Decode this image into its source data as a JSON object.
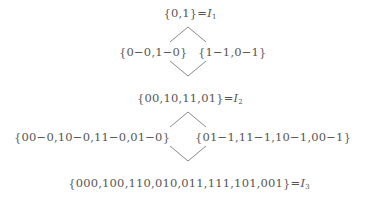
{
  "diagram": {
    "level1": {
      "set": "{0,1}",
      "eq": "=",
      "var": "I",
      "sub": "1"
    },
    "split1": {
      "left": "{0−0,1−0}",
      "right": "{1−1,0−1}"
    },
    "level2": {
      "set": "{00,10,11,01}",
      "eq": "=",
      "var": "I",
      "sub": "2"
    },
    "split2": {
      "left": "{00−0,10−0,11−0,01−0}",
      "right": "{01−1,11−1,10−1,00−1}"
    },
    "level3": {
      "set": "{000,100,110,010,011,111,101,001}",
      "eq": "=",
      "var": "I",
      "sub": "3"
    },
    "line_color": "#888888",
    "text_color": "#555555"
  }
}
